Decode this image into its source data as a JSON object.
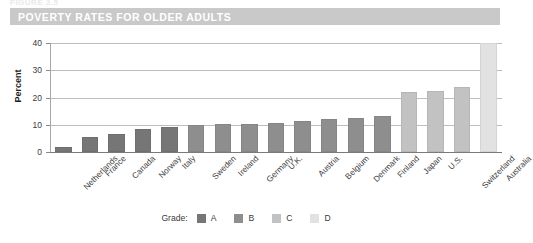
{
  "figure": {
    "number_text": "FIGURE 2.5",
    "title": "POVERTY RATES FOR OLDER ADULTS",
    "title_band_color": "#c9c9c9"
  },
  "legend": {
    "title": "Grade:",
    "items": [
      {
        "label": "A",
        "color": "#767676"
      },
      {
        "label": "B",
        "color": "#8e8e8e"
      },
      {
        "label": "C",
        "color": "#c2c2c2"
      },
      {
        "label": "D",
        "color": "#e2e2e2"
      }
    ]
  },
  "chart_data": {
    "type": "bar",
    "title": "POVERTY RATES FOR OLDER ADULTS",
    "xlabel": "",
    "ylabel": "Percent",
    "ylim": [
      0,
      40
    ],
    "yticks": [
      0,
      10,
      20,
      30,
      40
    ],
    "ytick_labels": [
      "0",
      "10",
      "20",
      "30",
      "40"
    ],
    "grid": true,
    "legend_position": "bottom",
    "categories": [
      "Netherlands",
      "France",
      "Canada",
      "Norway",
      "Italy",
      "Sweden",
      "Ireland",
      "Germany",
      "U.K.",
      "Austria",
      "Belgium",
      "Denmark",
      "Finland",
      "Japan",
      "U.S.",
      "Switzerland",
      "Australia"
    ],
    "values": [
      2.0,
      5.5,
      6.7,
      8.3,
      9.3,
      10.0,
      10.1,
      10.3,
      10.6,
      11.2,
      12.2,
      12.5,
      13.2,
      22.0,
      22.5,
      24.0,
      40.0
    ],
    "grades": [
      "A",
      "A",
      "A",
      "A",
      "A",
      "B",
      "B",
      "B",
      "B",
      "B",
      "B",
      "B",
      "B",
      "C",
      "C",
      "C",
      "D"
    ],
    "grade_colors": {
      "A": "#767676",
      "B": "#8e8e8e",
      "C": "#c2c2c2",
      "D": "#e2e2e2"
    }
  }
}
